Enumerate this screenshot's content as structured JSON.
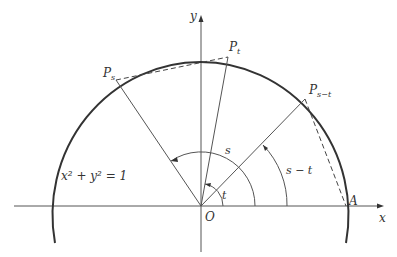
{
  "diagram": {
    "type": "unit-circle-angle-difference",
    "equation": "x² + y² = 1",
    "axes": {
      "x_label": "x",
      "y_label": "y"
    },
    "origin_label": "O",
    "points": {
      "A": "A",
      "Pt": {
        "base": "P",
        "sub": "t"
      },
      "Ps": {
        "base": "P",
        "sub": "s"
      },
      "Pst": {
        "base": "P",
        "sub": "s−t"
      }
    },
    "angles": {
      "s": "s",
      "t": "t",
      "s_minus_t": "s − t"
    }
  }
}
